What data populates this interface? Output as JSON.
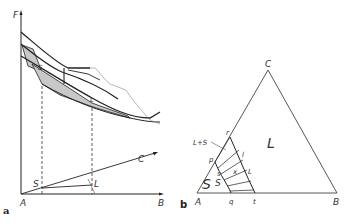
{
  "panel_a": {
    "panel_label": "a",
    "axes": {
      "vertical_label": "F",
      "origin_label": "A",
      "x_label": "B",
      "diagonal_label": "C"
    },
    "surface_labels": {
      "solid_surface": "S",
      "liquid_surface": "L"
    },
    "base_points": {
      "solid": "S",
      "liquid": "L"
    }
  },
  "panel_b": {
    "panel_label": "b",
    "vertices": {
      "a": "A",
      "b": "B",
      "c": "C"
    },
    "regions": {
      "liquid": "L",
      "solid": "S",
      "two_phase": "L+S"
    },
    "points": {
      "p": "p",
      "q": "q",
      "r": "r",
      "t": "t",
      "x": "x"
    },
    "tie_line_labels": {
      "s1": "s",
      "s2": "S",
      "l1": "l",
      "l2": "L"
    }
  },
  "colors": {
    "line": "#222222",
    "shading": "#c8c8c8",
    "background": "#ffffff",
    "thin_line": "#777777"
  }
}
